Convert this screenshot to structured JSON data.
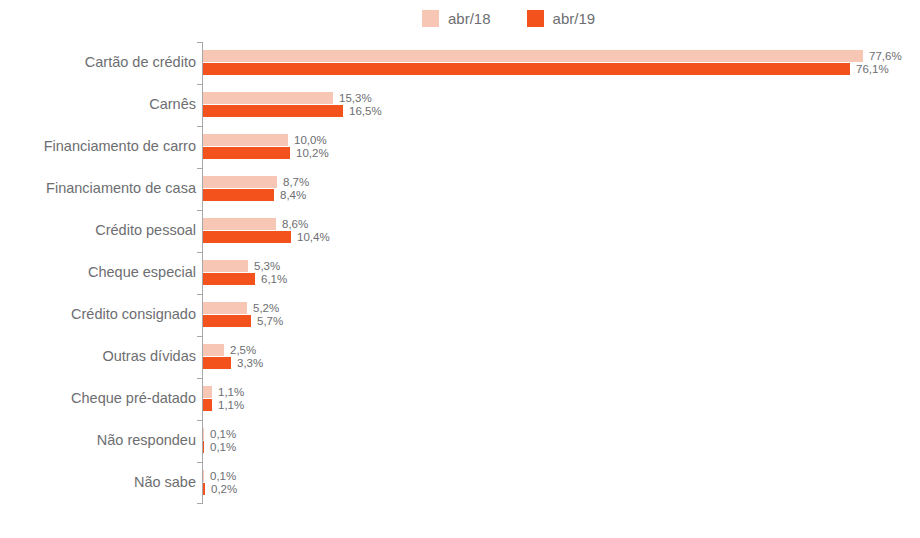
{
  "chart_data": {
    "type": "bar",
    "orientation": "horizontal",
    "title": "",
    "xlabel": "",
    "ylabel": "",
    "unit": "%",
    "decimal_separator": ",",
    "grid": false,
    "legend_position": "top-center",
    "xlim": [
      0,
      84
    ],
    "categories": [
      "Cartão de crédito",
      "Carnês",
      "Financiamento de carro",
      "Financiamento de casa",
      "Crédito pessoal",
      "Cheque especial",
      "Crédito consignado",
      "Outras dívidas",
      "Cheque pré-datado",
      "Não respondeu",
      "Não sabe"
    ],
    "series": [
      {
        "name": "abr/18",
        "color": "#F7C6B4",
        "values": [
          77.6,
          15.3,
          10.0,
          8.7,
          8.6,
          5.3,
          5.2,
          2.5,
          1.1,
          0.1,
          0.1
        ],
        "labels": [
          "77,6%",
          "15,3%",
          "10,0%",
          "8,7%",
          "8,6%",
          "5,3%",
          "5,2%",
          "2,5%",
          "1,1%",
          "0,1%",
          "0,1%"
        ]
      },
      {
        "name": "abr/19",
        "color": "#F4521C",
        "values": [
          76.1,
          16.5,
          10.2,
          8.4,
          10.4,
          6.1,
          5.7,
          3.3,
          1.1,
          0.1,
          0.2
        ],
        "labels": [
          "76,1%",
          "16,5%",
          "10,2%",
          "8,4%",
          "10,4%",
          "6,1%",
          "5,7%",
          "3,3%",
          "1,1%",
          "0,1%",
          "0,2%"
        ]
      }
    ]
  },
  "legend": {
    "items": [
      {
        "label": "abr/18",
        "color": "#F7C6B4"
      },
      {
        "label": "abr/19",
        "color": "#F4521C"
      }
    ]
  },
  "styles": {
    "text_color": "#6D6E71",
    "axis_color": "#A6A8AB",
    "background": "#ffffff"
  }
}
